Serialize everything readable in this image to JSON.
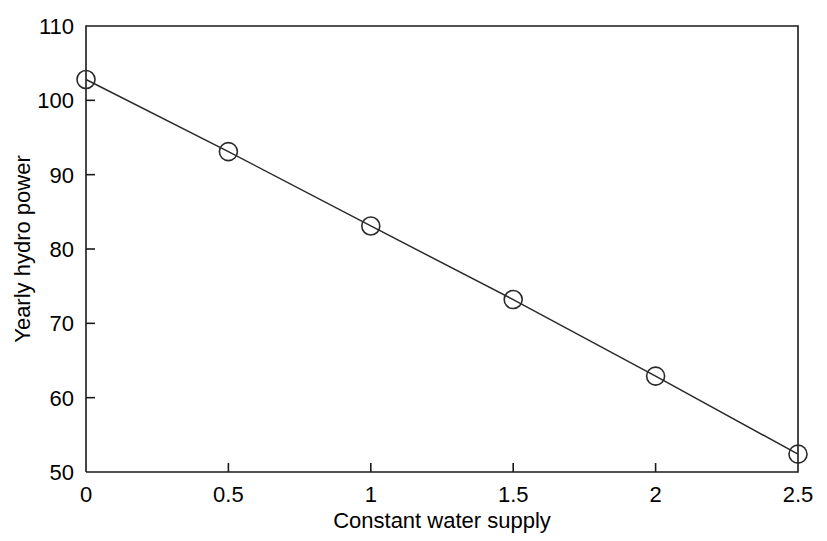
{
  "chart_data": {
    "type": "line",
    "title": "",
    "xlabel": "Constant water supply",
    "ylabel": "Yearly hydro power",
    "xlim": [
      0,
      2.5
    ],
    "ylim": [
      50,
      110
    ],
    "xticks": [
      0,
      0.5,
      1,
      1.5,
      2,
      2.5
    ],
    "xtick_labels": [
      "0",
      "0.5",
      "1",
      "1.5",
      "2",
      "2.5"
    ],
    "yticks": [
      50,
      60,
      70,
      80,
      90,
      100,
      110
    ],
    "ytick_labels": [
      "50",
      "60",
      "70",
      "80",
      "90",
      "100",
      "110"
    ],
    "grid": false,
    "legend": null,
    "marker": "circle-open",
    "line_color": "#2a2a2a",
    "x": [
      0,
      0.5,
      1,
      1.5,
      2,
      2.5
    ],
    "values": [
      102.8,
      93.1,
      83.1,
      73.2,
      62.9,
      52.4
    ],
    "series": [
      {
        "name": "Yearly hydro power",
        "x": [
          0,
          0.5,
          1,
          1.5,
          2,
          2.5
        ],
        "values": [
          102.8,
          93.1,
          83.1,
          73.2,
          62.9,
          52.4
        ]
      }
    ]
  },
  "axes": {
    "x_title": "Constant water supply",
    "y_title": "Yearly hydro power"
  },
  "ticks": {
    "x": [
      "0",
      "0.5",
      "1",
      "1.5",
      "2",
      "2.5"
    ],
    "y": [
      "110",
      "100",
      "90",
      "80",
      "70",
      "60",
      "50"
    ]
  }
}
